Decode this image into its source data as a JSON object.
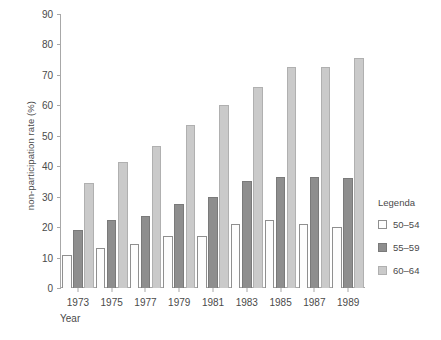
{
  "chart_data": {
    "type": "bar",
    "title": "",
    "subtitle": "",
    "xlabel": "Year",
    "ylabel": "non-participation rate (%)",
    "categories": [
      "1973",
      "1975",
      "1977",
      "1979",
      "1981",
      "1983",
      "1985",
      "1987",
      "1989"
    ],
    "ylim": [
      0,
      90
    ],
    "yticks": [
      0,
      10,
      20,
      30,
      40,
      50,
      60,
      70,
      80,
      90
    ],
    "grid": false,
    "legend_position": "right",
    "legend_title": "Legenda",
    "series": [
      {
        "name": "50–54",
        "color": "#fdfdfd",
        "values": [
          11,
          13,
          14.5,
          17,
          17,
          21,
          22.5,
          21,
          20
        ]
      },
      {
        "name": "55–59",
        "color": "#8e8e8e",
        "values": [
          19,
          22.5,
          23.5,
          27.5,
          30,
          35,
          36.5,
          36.5,
          36
        ]
      },
      {
        "name": "60–64",
        "color": "#cacaca",
        "values": [
          34.5,
          41.5,
          46.5,
          53.5,
          60,
          66,
          72.5,
          72.5,
          75.5
        ]
      }
    ]
  }
}
